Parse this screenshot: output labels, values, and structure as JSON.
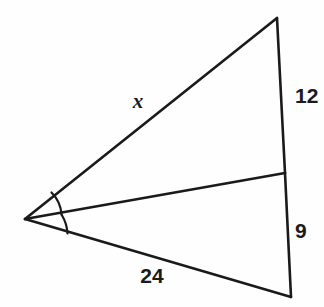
{
  "figure": {
    "type": "geometry-diagram",
    "background_color": "#fefefe",
    "stroke_color": "#1a1a1a",
    "vertices": {
      "apex": {
        "name": "apex-vertex",
        "x": 25,
        "y": 219
      },
      "top": {
        "name": "top-vertex",
        "x": 277,
        "y": 18
      },
      "cevian_foot": {
        "name": "cevian-foot-vertex",
        "x": 285,
        "y": 173
      },
      "bottom": {
        "name": "bottom-vertex",
        "x": 291,
        "y": 297
      }
    },
    "segments": [
      {
        "id": "side-x",
        "label": "x",
        "from": "apex",
        "to": "top"
      },
      {
        "id": "side-12",
        "label": "12",
        "from": "top",
        "to": "cevian_foot"
      },
      {
        "id": "side-9",
        "label": "9",
        "from": "cevian_foot",
        "to": "bottom"
      },
      {
        "id": "side-24",
        "label": "24",
        "from": "bottom",
        "to": "apex"
      },
      {
        "id": "bisector",
        "label": "",
        "from": "apex",
        "to": "cevian_foot"
      }
    ],
    "labels": {
      "x": {
        "text": "x",
        "x": 138,
        "y": 103,
        "italic": true
      },
      "twelve": {
        "text": "12",
        "x": 295,
        "y": 97,
        "italic": false
      },
      "nine": {
        "text": "9",
        "x": 295,
        "y": 232,
        "italic": false
      },
      "twentyfour": {
        "text": "24",
        "x": 152,
        "y": 277,
        "italic": false
      }
    },
    "angle_marks": [
      {
        "id": "upper-angle-arc",
        "name": "angle-arc-upper",
        "between": [
          "side-x",
          "bisector"
        ]
      },
      {
        "id": "lower-angle-arc",
        "name": "angle-arc-lower",
        "between": [
          "bisector",
          "side-24"
        ]
      }
    ]
  }
}
